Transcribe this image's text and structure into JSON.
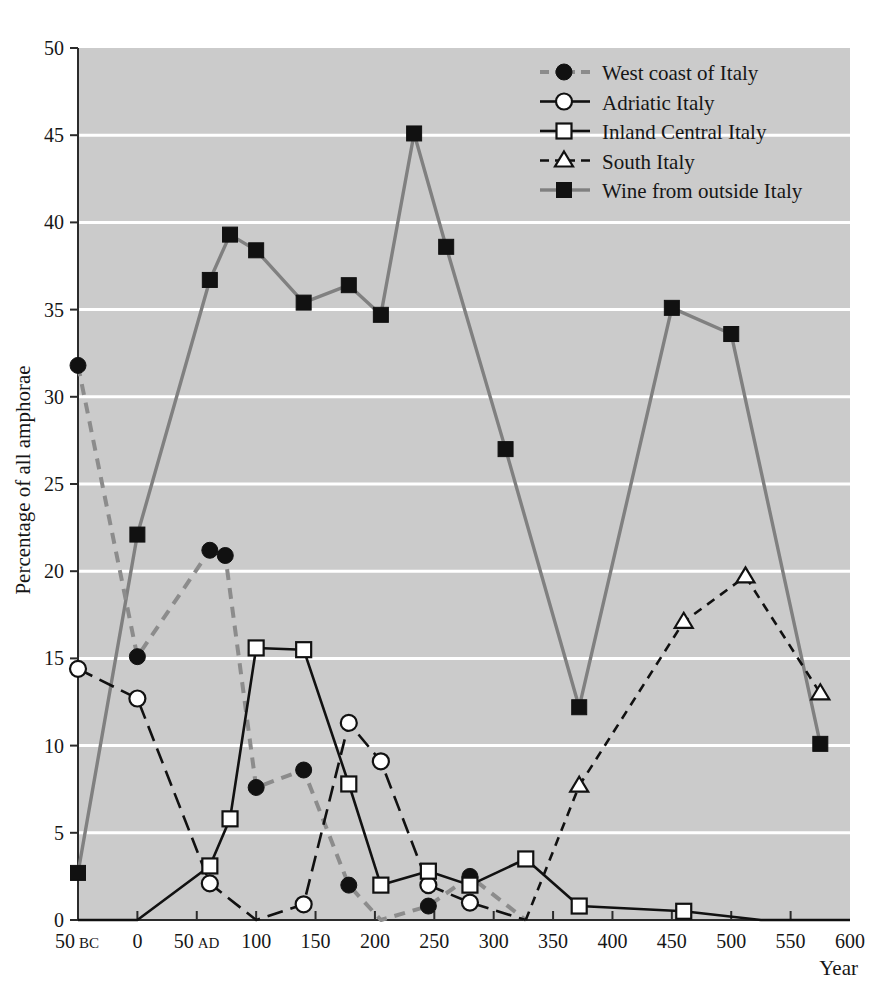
{
  "chart_data": {
    "type": "line",
    "title": "",
    "xlabel": "Year",
    "ylabel": "Percentage of all amphorae",
    "xlim": [
      -50,
      600
    ],
    "ylim": [
      0,
      50
    ],
    "grid": true,
    "grid_orientation": "horizontal",
    "legend_position": "top-right",
    "plot_background": "#cbcbcb",
    "grid_color": "#ffffff",
    "x_ticks": [
      {
        "value": -50,
        "label": "50",
        "suffix": "BC"
      },
      {
        "value": 0,
        "label": "0",
        "suffix": ""
      },
      {
        "value": 50,
        "label": "50",
        "suffix": "AD"
      },
      {
        "value": 100,
        "label": "100",
        "suffix": ""
      },
      {
        "value": 150,
        "label": "150",
        "suffix": ""
      },
      {
        "value": 200,
        "label": "200",
        "suffix": ""
      },
      {
        "value": 250,
        "label": "250",
        "suffix": ""
      },
      {
        "value": 300,
        "label": "300",
        "suffix": ""
      },
      {
        "value": 350,
        "label": "350",
        "suffix": ""
      },
      {
        "value": 400,
        "label": "400",
        "suffix": ""
      },
      {
        "value": 450,
        "label": "450",
        "suffix": ""
      },
      {
        "value": 500,
        "label": "500",
        "suffix": ""
      },
      {
        "value": 550,
        "label": "550",
        "suffix": ""
      },
      {
        "value": 600,
        "label": "600",
        "suffix": ""
      }
    ],
    "y_ticks": [
      0,
      5,
      10,
      15,
      20,
      25,
      30,
      35,
      40,
      45,
      50
    ],
    "series": [
      {
        "name": "West coast of Italy",
        "marker": "filled-circle",
        "line_style": "dashed",
        "color": "#8c8c8c",
        "marker_color": "#111111",
        "x": [
          -50,
          0,
          61,
          74,
          100,
          140,
          178,
          205,
          245,
          280,
          327
        ],
        "y": [
          31.8,
          15.1,
          21.2,
          20.9,
          7.6,
          8.6,
          2.0,
          0.0,
          0.8,
          2.5,
          0.0
        ]
      },
      {
        "name": "Adriatic Italy",
        "marker": "open-circle",
        "line_style": "long-dash",
        "color": "#111111",
        "marker_color": "#ffffff",
        "x": [
          -50,
          0,
          61,
          100,
          140,
          178,
          205,
          245,
          280,
          327
        ],
        "y": [
          14.4,
          12.7,
          2.1,
          0.0,
          0.9,
          11.3,
          9.1,
          2.0,
          1.0,
          0.0
        ]
      },
      {
        "name": "Inland Central Italy",
        "marker": "open-square",
        "line_style": "solid",
        "color": "#111111",
        "marker_color": "#ffffff",
        "x": [
          -50,
          0,
          61,
          78,
          100,
          140,
          178,
          205,
          245,
          280,
          327,
          372,
          460,
          525,
          600
        ],
        "y": [
          0.0,
          0.0,
          3.1,
          5.8,
          15.6,
          15.5,
          7.8,
          2.0,
          2.8,
          2.0,
          3.5,
          0.8,
          0.5,
          0.0,
          0.0
        ]
      },
      {
        "name": "South Italy",
        "marker": "open-triangle",
        "line_style": "dashed",
        "color": "#111111",
        "marker_color": "#ffffff",
        "x": [
          327,
          372,
          460,
          512,
          575
        ],
        "y": [
          0.0,
          7.7,
          17.1,
          19.7,
          13.0
        ]
      },
      {
        "name": "Wine from outside Italy",
        "marker": "filled-square",
        "line_style": "solid",
        "color": "#808080",
        "marker_color": "#111111",
        "x": [
          -50,
          0,
          61,
          78,
          100,
          140,
          178,
          205,
          233,
          260,
          310,
          372,
          450,
          500,
          575
        ],
        "y": [
          2.7,
          22.1,
          36.7,
          39.3,
          38.4,
          35.4,
          36.4,
          34.7,
          45.1,
          38.6,
          27.0,
          12.2,
          35.1,
          33.6,
          10.1
        ]
      }
    ]
  },
  "axis": {
    "y_title": "Percentage of all amphorae",
    "x_title": "Year",
    "bc_suffix": "BC",
    "ad_suffix": "AD"
  }
}
